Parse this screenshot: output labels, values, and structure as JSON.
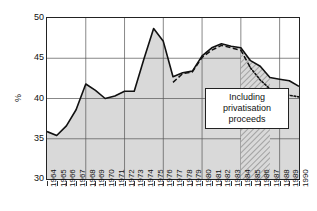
{
  "chart_data": {
    "type": "line",
    "title": "",
    "xlabel": "",
    "ylabel": "%",
    "ylim": [
      30,
      50
    ],
    "yticks": [
      30,
      35,
      40,
      45,
      50
    ],
    "xlim": [
      1964,
      1990
    ],
    "grid": true,
    "gridlines_x": [
      1968,
      1972,
      1976,
      1980,
      1984,
      1988
    ],
    "legend": "none",
    "categories": [
      1964,
      1965,
      1966,
      1967,
      1968,
      1969,
      1970,
      1971,
      1972,
      1973,
      1974,
      1975,
      1976,
      1977,
      1978,
      1979,
      1980,
      1981,
      1982,
      1983,
      1984,
      1985,
      1986,
      1987,
      1988,
      1989,
      1990
    ],
    "series": [
      {
        "name": "General government expenditure",
        "style": "solid",
        "fill": "shaded",
        "values": [
          35.9,
          35.4,
          36.6,
          38.6,
          41.8,
          41.0,
          40.0,
          40.3,
          40.9,
          40.9,
          44.9,
          48.7,
          47.1,
          42.7,
          43.2,
          43.4,
          45.3,
          46.3,
          46.8,
          46.5,
          46.3,
          44.7,
          44.0,
          42.6,
          42.4,
          42.2,
          41.5
        ]
      },
      {
        "name": "Including privatisation proceeds",
        "style": "dashed-dotted",
        "values": [
          null,
          null,
          null,
          null,
          null,
          null,
          null,
          null,
          null,
          null,
          null,
          null,
          null,
          42.0,
          43.1,
          43.3,
          45.1,
          46.0,
          46.6,
          46.3,
          46.0,
          43.8,
          42.3,
          41.2,
          40.7,
          40.4,
          40.2
        ]
      }
    ],
    "annotations": [
      {
        "name": "privatisation-callout",
        "lines": [
          "Including",
          "privatisation",
          "proceeds"
        ],
        "hatched_region": {
          "from": 1984,
          "to": 1987
        }
      }
    ]
  },
  "axis": {
    "y_ticks": [
      "50",
      "45",
      "40",
      "35",
      "30"
    ],
    "y_title": "%",
    "x_ticks": [
      "1964",
      "1965",
      "1966",
      "1967",
      "1968",
      "1969",
      "1970",
      "1971",
      "1972",
      "1973",
      "1974",
      "1975",
      "1976",
      "1977",
      "1978",
      "1979",
      "1980",
      "1981",
      "1982",
      "1983",
      "1984",
      "1985",
      "1986",
      "1987",
      "1988",
      "1989",
      "1990"
    ]
  },
  "callout": {
    "line1": "Including",
    "line2": "privatisation",
    "line3": "proceeds"
  },
  "colors": {
    "axis": "#222222",
    "line": "#111111",
    "fill": "#d9d9d9",
    "grid": "#ffffff",
    "background": "#ffffff"
  }
}
